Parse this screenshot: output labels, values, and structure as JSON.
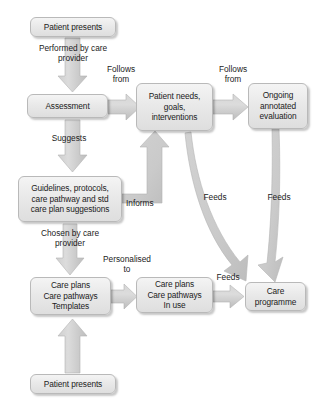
{
  "diagram": {
    "colors": {
      "node_fill_top": "#f4f4f4",
      "node_fill_bottom": "#dedede",
      "node_border": "#b9b9b9",
      "arrow_fill": "#c6c6c6",
      "arrow_edge": "#b0b0b0",
      "text": "#1b1b1b",
      "background": "#ffffff"
    },
    "nodes": {
      "patient_presents_top": "Patient presents",
      "assessment": "Assessment",
      "patient_needs": "Patient needs,\ngoals,\ninterventions",
      "ongoing_evaluation": "Ongoing\nannotated\nevaluation",
      "guidelines": "Guidelines, protocols,\ncare pathway and std\ncare plan suggestions",
      "care_plans_templates": "Care plans\nCare pathways\nTemplates",
      "care_plans_in_use": "Care plans\nCare pathways\nIn use",
      "care_programme": "Care\nprogramme",
      "patient_presents_bottom": "Patient presents"
    },
    "edge_labels": {
      "performed_by": "Performed by care\nprovider",
      "follows_from_1": "Follows\nfrom",
      "follows_from_2": "Follows\nfrom",
      "suggests": "Suggests",
      "informs": "Informs",
      "feeds_1": "Feeds",
      "feeds_2": "Feeds",
      "feeds_3": "Feeds",
      "chosen_by": "Chosen by care\nprovider",
      "personalised_to": "Personalised\nto"
    }
  }
}
